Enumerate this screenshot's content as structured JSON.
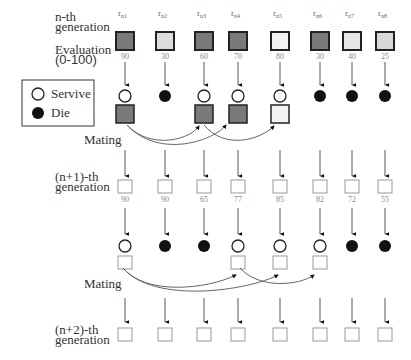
{
  "labels": {
    "nth_generation": [
      "n-th",
      "generation"
    ],
    "evaluation": [
      "Evaluation",
      "(0-100)"
    ],
    "mating_1": "Mating",
    "n1_generation": [
      "(n+1)-th",
      "generation"
    ],
    "mating_2": "Mating",
    "n2_generation": [
      "(n+2)-th",
      "generation"
    ]
  },
  "legend": {
    "survive": "Servive",
    "die": "Die"
  },
  "individuals": [
    "r n1",
    "r n2",
    "r n3",
    "r n4",
    "r n5",
    "r n6",
    "r n7",
    "r n8"
  ],
  "gen_n": {
    "evaluations": [
      "90",
      "30",
      "60",
      "70",
      "80",
      "30",
      "40",
      "25"
    ],
    "fills": [
      "#7a7a7a",
      "#dcdcdc",
      "#7a7a7a",
      "#7a7a7a",
      "#f2f2f2",
      "#7a7a7a",
      "#e6e6e6",
      "#d8d8d8"
    ],
    "fate": [
      "survive",
      "die",
      "survive",
      "survive",
      "survive",
      "die",
      "die",
      "die"
    ]
  },
  "gen_n1": {
    "evaluations": [
      "90",
      "90",
      "65",
      "77",
      "85",
      "82",
      "72",
      "55"
    ],
    "fate": [
      "survive",
      "die",
      "die",
      "survive",
      "survive",
      "survive",
      "die",
      "die"
    ]
  },
  "gen_n2": {
    "count": 8
  },
  "colors": {
    "dark_box": "#7a7a7a",
    "die": "#111111",
    "line": "#444444"
  }
}
